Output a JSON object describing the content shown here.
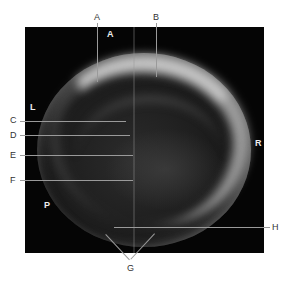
{
  "figure": {
    "outer_labels": {
      "A": "A",
      "B": "B",
      "C": "C",
      "D": "D",
      "E": "E",
      "F": "F",
      "G": "G",
      "H": "H"
    },
    "orientation_labels": {
      "top": "A",
      "left": "L",
      "right": "R",
      "bottom_left": "P"
    },
    "colors": {
      "background": "#ffffff",
      "panel": "#050505",
      "leader_line": "#9a9a9a",
      "label_text": "#333333",
      "orientation_text": "#eeeeee"
    }
  }
}
